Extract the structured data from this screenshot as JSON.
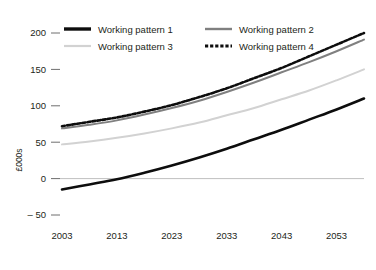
{
  "chart_data": {
    "type": "line",
    "title": "",
    "xlabel": "",
    "ylabel": "£000s",
    "xlim": [
      2003,
      2058
    ],
    "ylim": [
      -50,
      200
    ],
    "grid": false,
    "zero_line": true,
    "legend_position": "top",
    "x_ticks": [
      "2003",
      "2013",
      "2023",
      "2033",
      "2043",
      "2053"
    ],
    "x_tick_values": [
      2003,
      2013,
      2023,
      2033,
      2043,
      2053
    ],
    "y_ticks": [
      "200",
      "150",
      "100",
      "50",
      "0",
      "– 50"
    ],
    "y_tick_values": [
      200,
      150,
      100,
      50,
      0,
      -50
    ],
    "x": [
      2003,
      2008,
      2013,
      2018,
      2023,
      2028,
      2033,
      2038,
      2043,
      2048,
      2053,
      2058
    ],
    "series": [
      {
        "name": "Working pattern 1",
        "color": "#0d0d0d",
        "style": "solid",
        "width": 2.6,
        "values": [
          -15,
          -8,
          -1,
          8,
          18,
          29,
          41,
          54,
          67,
          81,
          95,
          110
        ]
      },
      {
        "name": "Working pattern 2",
        "color": "#808080",
        "style": "solid",
        "width": 2.0,
        "values": [
          69,
          74,
          80,
          88,
          97,
          107,
          119,
          132,
          146,
          160,
          175,
          191
        ]
      },
      {
        "name": "Working pattern 3",
        "color": "#d2d2d2",
        "style": "solid",
        "width": 2.0,
        "values": [
          47,
          51,
          56,
          62,
          69,
          77,
          87,
          97,
          109,
          121,
          135,
          150
        ]
      },
      {
        "name": "Working pattern 4",
        "color": "#0d0d0d",
        "style": "dashed",
        "width": 2.6,
        "values": [
          72,
          78,
          84,
          92,
          101,
          112,
          124,
          138,
          152,
          168,
          184,
          200
        ]
      }
    ]
  },
  "legend": {
    "items": [
      {
        "label": "Working pattern 1",
        "color": "#0d0d0d",
        "style": "solid",
        "width": 3.4
      },
      {
        "label": "Working pattern 2",
        "color": "#808080",
        "style": "solid",
        "width": 2.4
      },
      {
        "label": "Working pattern 3",
        "color": "#d2d2d2",
        "style": "solid",
        "width": 2.2
      },
      {
        "label": "Working pattern 4",
        "color": "#0d0d0d",
        "style": "dashed",
        "width": 3.0
      }
    ]
  },
  "colors": {
    "text": "#231f20",
    "axis": "#bfbfbf",
    "tick": "#6e6e6e",
    "background": "#ffffff"
  }
}
